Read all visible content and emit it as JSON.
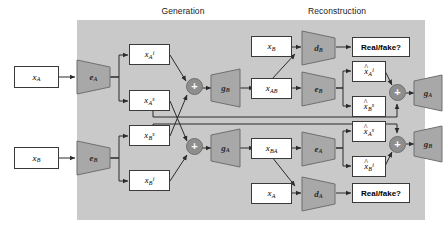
{
  "figure": {
    "type": "architecture-diagram",
    "panels": [
      {
        "id": "generation",
        "title": "Generation"
      },
      {
        "id": "reconstruction",
        "title": "Reconstruction"
      }
    ],
    "colors": {
      "panel_fill": "#c9c9c9",
      "block_fill": "#a8a8a8",
      "merge_fill": "#8e8e8e",
      "box_fill": "#ffffff",
      "stroke": "#3a3a3a",
      "background": "#ffffff"
    }
  },
  "inputs": {
    "x_a_left": {
      "base": "x",
      "sub": "A"
    },
    "x_b_left": {
      "base": "x",
      "sub": "B"
    }
  },
  "generation": {
    "encoder_a": {
      "base": "e",
      "sub": "A"
    },
    "encoder_b": {
      "base": "e",
      "sub": "B"
    },
    "codes": {
      "x_a_i": {
        "base": "x",
        "sub": "A",
        "sup": "i"
      },
      "x_a_s": {
        "base": "x",
        "sub": "A",
        "sup": "s"
      },
      "x_b_s": {
        "base": "x",
        "sub": "B",
        "sup": "s"
      },
      "x_b_i": {
        "base": "x",
        "sub": "B",
        "sup": "i"
      }
    },
    "merge_symbol": "+",
    "generator_b": {
      "base": "g",
      "sub": "B"
    },
    "generator_a": {
      "base": "g",
      "sub": "A"
    }
  },
  "middle": {
    "x_b_real": {
      "base": "x",
      "sub": "B"
    },
    "x_ab": {
      "base": "x",
      "sub": "AB"
    },
    "x_ba": {
      "base": "x",
      "sub": "BA"
    },
    "x_a_real": {
      "base": "x",
      "sub": "A"
    }
  },
  "reconstruction": {
    "discriminator_b": {
      "base": "d",
      "sub": "B"
    },
    "discriminator_a": {
      "base": "d",
      "sub": "A"
    },
    "encoder_b": {
      "base": "e",
      "sub": "B"
    },
    "encoder_a": {
      "base": "e",
      "sub": "A"
    },
    "codes": {
      "xhat_a_i": {
        "hat": "^",
        "base": "x",
        "sub": "A",
        "sup": "i"
      },
      "xhat_b_s": {
        "hat": "^",
        "base": "x",
        "sub": "B",
        "sup": "s"
      },
      "xhat_a_s": {
        "hat": "^",
        "base": "x",
        "sub": "A",
        "sup": "s"
      },
      "xhat_b_i": {
        "hat": "^",
        "base": "x",
        "sub": "B",
        "sup": "i"
      }
    },
    "merge_symbol": "+",
    "generator_a": {
      "base": "g",
      "sub": "A"
    },
    "generator_b": {
      "base": "g",
      "sub": "B"
    },
    "answer_top": "Real/fake?",
    "answer_bottom": "Real/fake?"
  },
  "outputs": {
    "xhat_a": {
      "hat": "^",
      "base": "x",
      "sub": "A"
    },
    "xhat_b": {
      "hat": "^",
      "base": "x",
      "sub": "B"
    }
  }
}
